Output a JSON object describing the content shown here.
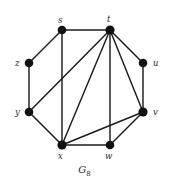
{
  "figure": {
    "caption_base": "G",
    "caption_subscript": "8",
    "caption_full": "G8",
    "caption_top": 164,
    "background_color": "#ffffff",
    "edge_color": "#1c1c1c",
    "vertex_color": "#111111",
    "label_color": "#2b2b2b",
    "width": 169,
    "height": 187
  },
  "graph": {
    "type": "undirected-graph",
    "vertex_count": 8,
    "edge_count": 14,
    "vertices": [
      {
        "id": "s",
        "label": "s",
        "cx": 62,
        "cy": 30,
        "r": 4.3,
        "label_x": 58,
        "label_y": 16
      },
      {
        "id": "t",
        "label": "t",
        "cx": 110,
        "cy": 30,
        "r": 4.6,
        "label_x": 107,
        "label_y": 15
      },
      {
        "id": "u",
        "label": "u",
        "cx": 143,
        "cy": 63,
        "r": 4.3,
        "label_x": 153,
        "label_y": 59
      },
      {
        "id": "v",
        "label": "v",
        "cx": 143,
        "cy": 112,
        "r": 4.6,
        "label_x": 153,
        "label_y": 108
      },
      {
        "id": "w",
        "label": "w",
        "cx": 110,
        "cy": 145,
        "r": 4.3,
        "label_x": 105,
        "label_y": 152
      },
      {
        "id": "x",
        "label": "x",
        "cx": 62,
        "cy": 145,
        "r": 4.6,
        "label_x": 58,
        "label_y": 152
      },
      {
        "id": "y",
        "label": "y",
        "cx": 29,
        "cy": 112,
        "r": 4.3,
        "label_x": 15,
        "label_y": 108
      },
      {
        "id": "z",
        "label": "z",
        "cx": 29,
        "cy": 63,
        "r": 4.3,
        "label_x": 15,
        "label_y": 59
      }
    ],
    "edges": [
      {
        "from": "s",
        "to": "t"
      },
      {
        "from": "s",
        "to": "z"
      },
      {
        "from": "s",
        "to": "x"
      },
      {
        "from": "t",
        "to": "u"
      },
      {
        "from": "t",
        "to": "v"
      },
      {
        "from": "t",
        "to": "w"
      },
      {
        "from": "t",
        "to": "x"
      },
      {
        "from": "t",
        "to": "y"
      },
      {
        "from": "u",
        "to": "v"
      },
      {
        "from": "v",
        "to": "w"
      },
      {
        "from": "v",
        "to": "x"
      },
      {
        "from": "w",
        "to": "x"
      },
      {
        "from": "x",
        "to": "y"
      },
      {
        "from": "y",
        "to": "z"
      }
    ]
  }
}
